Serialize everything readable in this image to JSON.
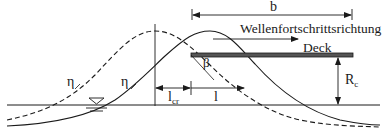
{
  "diagram": {
    "type": "wave-deck-impact-schematic",
    "labels": {
      "width": "b",
      "direction": "Wellenfortschrittsrichtung",
      "deck": "Deck",
      "angle": "β",
      "eta_left": "η",
      "eta_right": "η",
      "l_cr_main": "l",
      "l_cr_sub": "cr",
      "l": "l",
      "rc_main": "R",
      "rc_sub": "c"
    },
    "elements": {
      "wave_dashed": "wave profile (earlier position), dashed",
      "wave_solid": "wave profile (current position), solid",
      "water_level_symbol": "still water level (▽)",
      "deck_beam": "horizontal deck"
    },
    "colors": {
      "line": "#1a1a1a",
      "deck": "#333333",
      "background": "#ffffff"
    }
  }
}
